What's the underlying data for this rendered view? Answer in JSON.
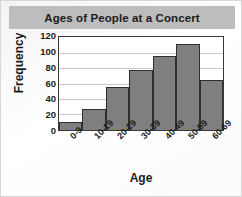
{
  "chart_data": {
    "type": "bar",
    "title": "Ages of People at a Concert",
    "xlabel": "Age",
    "ylabel": "Frequency",
    "categories": [
      "0-9",
      "10-19",
      "20-29",
      "30-39",
      "40-49",
      "50-59",
      "60-69"
    ],
    "values": [
      10,
      27,
      56,
      77,
      95,
      111,
      64
    ],
    "ylim": [
      0,
      120
    ],
    "yticks": [
      120,
      100,
      80,
      60,
      40,
      20,
      0
    ],
    "grid": true,
    "legend": "none",
    "colors": {
      "bar_fill": "#7f7f7f",
      "bar_edge": "#2e2e2e",
      "title_banner": "#bdbdbd",
      "plot_background": "#ffffff",
      "gridline": "#c9c9c9",
      "text": "#1b1b1b"
    }
  }
}
